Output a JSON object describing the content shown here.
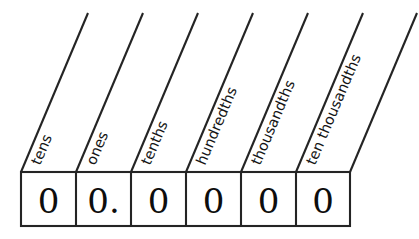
{
  "diagram": {
    "colors": {
      "background": "#ffffff",
      "line": "#242424",
      "text": "#0d0d0d"
    },
    "columns": [
      {
        "label": "tens",
        "digit": "0",
        "place": "tens"
      },
      {
        "label": "ones",
        "digit": "0.",
        "place": "ones"
      },
      {
        "label": "tenths",
        "digit": "0",
        "place": "tenths"
      },
      {
        "label": "hundredths",
        "digit": "0",
        "place": "hundredths"
      },
      {
        "label": "thousandths",
        "digit": "0",
        "place": "thousandths"
      },
      {
        "label": "ten thousandths",
        "digit": "0",
        "place": "ten-thousandths"
      }
    ],
    "decimal_separator": ".",
    "value": "00.0000"
  }
}
